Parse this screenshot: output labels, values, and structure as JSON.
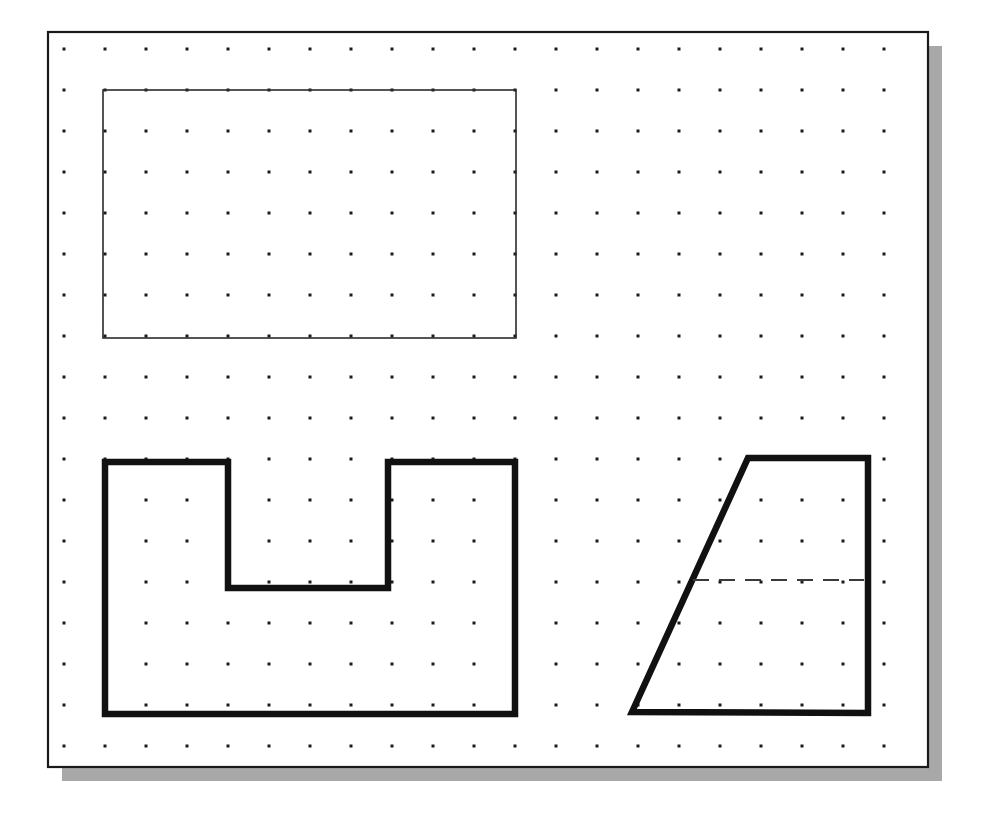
{
  "document": {
    "title": "Geometry Sketch Canvas",
    "background_color": "#ffffff"
  },
  "canvas": {
    "name": "drawing-sheet",
    "x": 48,
    "y": 32,
    "width": 880,
    "height": 735,
    "fill": "#ffffff",
    "border_color": "#1a1a1a",
    "border_width": 2.2,
    "shadow": {
      "offset_x": 14,
      "offset_y": 14,
      "color": "#a8a8a8"
    }
  },
  "grid": {
    "name": "dot-grid",
    "origin_x": 64,
    "origin_y": 49,
    "spacing_x": 41,
    "spacing_y": 41,
    "columns": 21,
    "rows": 18,
    "dot_size": 3,
    "dot_color": "#1a1a1a",
    "visible": true
  },
  "shapes": [
    {
      "id": "rectangle",
      "name": "thin-rectangle",
      "type": "rect",
      "label": "Rectangle",
      "x": 103,
      "y": 90,
      "width": 413,
      "height": 248,
      "stroke": "#2b2b2b",
      "stroke_width": 1.6,
      "fill": "none",
      "style": "solid"
    },
    {
      "id": "notched-polygon",
      "name": "u-shaped-polygon",
      "type": "polygon",
      "label": "Notched U Polygon",
      "points": "105,462 228,462 228,588 388,588 388,462 515,462 515,714 105,714",
      "stroke": "#111111",
      "stroke_width": 6.5,
      "fill": "none",
      "style": "solid"
    },
    {
      "id": "trapezoid",
      "name": "trapezoid-polygon",
      "type": "polygon",
      "label": "Trapezoid",
      "points": "748,458 868,458 868,713 632,712",
      "stroke": "#111111",
      "stroke_width": 6.5,
      "fill": "none",
      "style": "solid"
    },
    {
      "id": "trapezoid-centerline",
      "name": "dashed-center-line",
      "type": "line",
      "label": "Dashed Center Line",
      "x1": 693,
      "y1": 580,
      "x2": 864,
      "y2": 580,
      "stroke": "#3a3a3a",
      "stroke_width": 2,
      "fill": "none",
      "style": "dashed",
      "dash_pattern": "16 10"
    }
  ]
}
